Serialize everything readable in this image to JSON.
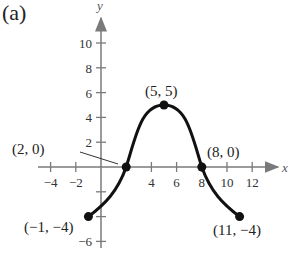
{
  "panel_label": "(a)",
  "chart_data": {
    "type": "line",
    "title": "",
    "xlabel": "x",
    "ylabel": "y",
    "xlim": [
      -5,
      14
    ],
    "ylim": [
      -7,
      12
    ],
    "grid": false,
    "x_ticks": [
      -4,
      -2,
      4,
      6,
      8,
      10,
      12
    ],
    "x_tick_labels": [
      "−4",
      "−2",
      "4",
      "6",
      "8",
      "10",
      "12"
    ],
    "y_ticks": [
      10,
      8,
      6,
      4,
      2,
      -6
    ],
    "y_tick_labels": [
      "10",
      "8",
      "6",
      "4",
      "2",
      "−6"
    ],
    "y_minor_ticks": [
      -2,
      -4
    ],
    "series": [
      {
        "name": "f(x)",
        "x": [
          -1,
          2,
          5,
          8,
          11
        ],
        "y": [
          -4,
          0,
          5,
          0,
          -4
        ],
        "shape": "smooth bell-shaped curve, symmetric about x = 5"
      }
    ],
    "marked_points": [
      {
        "x": -1,
        "y": -4,
        "label": "(−1, −4)"
      },
      {
        "x": 2,
        "y": 0,
        "label": "(2, 0)"
      },
      {
        "x": 5,
        "y": 5,
        "label": "(5, 5)"
      },
      {
        "x": 8,
        "y": 0,
        "label": "(8, 0)"
      },
      {
        "x": 11,
        "y": -4,
        "label": "(11, −4)"
      }
    ]
  },
  "colors": {
    "axis": "#7a7a7a",
    "curve": "#111111",
    "text": "#222222"
  }
}
